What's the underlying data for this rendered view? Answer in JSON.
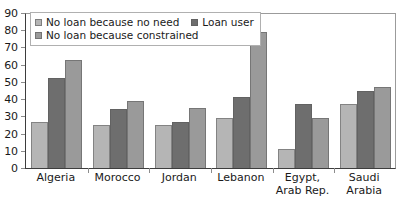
{
  "chart_data": {
    "type": "bar",
    "title": "",
    "xlabel": "",
    "ylabel": "",
    "ylim": [
      0,
      90
    ],
    "ytick_step": 10,
    "yticks": [
      0,
      10,
      20,
      30,
      40,
      50,
      60,
      70,
      80,
      90
    ],
    "grid": false,
    "legend_position": "top-left-inside",
    "categories": [
      "Algeria",
      "Morocco",
      "Jordan",
      "Lebanon",
      "Egypt,\nArab Rep.",
      "Saudi\nArabia"
    ],
    "series": [
      {
        "name": "No loan because no need",
        "color": "#b5b5b5",
        "values": [
          27,
          25,
          25,
          29,
          11,
          37
        ]
      },
      {
        "name": "Loan user",
        "color": "#6e6e6e",
        "values": [
          52,
          34,
          27,
          41,
          37,
          45
        ]
      },
      {
        "name": "No loan because constrained",
        "color": "#9a9a9a",
        "values": [
          63,
          39,
          35,
          79,
          29,
          47
        ]
      }
    ]
  },
  "legend": {
    "row1": [
      {
        "label": "No loan because no need",
        "color": "#b5b5b5"
      },
      {
        "label": "Loan user",
        "color": "#6e6e6e"
      }
    ],
    "row2": [
      {
        "label": "No loan because constrained",
        "color": "#9a9a9a"
      }
    ]
  },
  "axis": {
    "y_labels": [
      "90",
      "80",
      "70",
      "60",
      "50",
      "40",
      "30",
      "20",
      "10",
      "0"
    ]
  }
}
